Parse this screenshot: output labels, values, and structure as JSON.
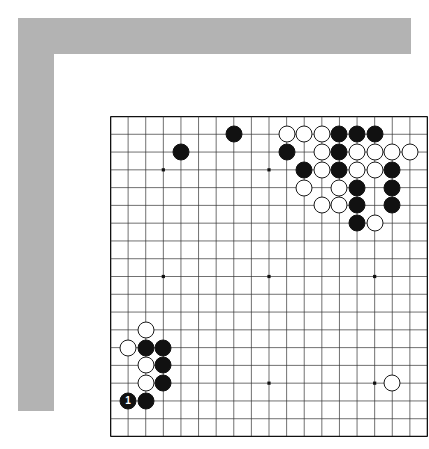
{
  "diagram": {
    "kind": "go-board-diagram",
    "board_size": 19,
    "frame_color": "#b3b3b3",
    "mat_color": "#ffffff",
    "board_color": "#ffffff",
    "line_color": "#333333",
    "border_color": "#111111",
    "black_stone_color": "#111111",
    "white_stone_color": "#ffffff",
    "star_points": [
      {
        "col": 4,
        "row": 4
      },
      {
        "col": 10,
        "row": 4
      },
      {
        "col": 16,
        "row": 4
      },
      {
        "col": 4,
        "row": 10
      },
      {
        "col": 10,
        "row": 10
      },
      {
        "col": 16,
        "row": 10
      },
      {
        "col": 4,
        "row": 16
      },
      {
        "col": 10,
        "row": 16
      },
      {
        "col": 16,
        "row": 16
      }
    ],
    "stones": [
      {
        "col": 8,
        "row": 2,
        "color": "black",
        "label": ""
      },
      {
        "col": 5,
        "row": 3,
        "color": "black",
        "label": ""
      },
      {
        "col": 11,
        "row": 2,
        "color": "white",
        "label": ""
      },
      {
        "col": 12,
        "row": 2,
        "color": "white",
        "label": ""
      },
      {
        "col": 13,
        "row": 2,
        "color": "white",
        "label": ""
      },
      {
        "col": 14,
        "row": 2,
        "color": "black",
        "label": ""
      },
      {
        "col": 15,
        "row": 2,
        "color": "black",
        "label": ""
      },
      {
        "col": 16,
        "row": 2,
        "color": "black",
        "label": ""
      },
      {
        "col": 11,
        "row": 3,
        "color": "black",
        "label": ""
      },
      {
        "col": 13,
        "row": 3,
        "color": "white",
        "label": ""
      },
      {
        "col": 14,
        "row": 3,
        "color": "black",
        "label": ""
      },
      {
        "col": 15,
        "row": 3,
        "color": "white",
        "label": ""
      },
      {
        "col": 16,
        "row": 3,
        "color": "white",
        "label": ""
      },
      {
        "col": 17,
        "row": 3,
        "color": "white",
        "label": ""
      },
      {
        "col": 18,
        "row": 3,
        "color": "white",
        "label": ""
      },
      {
        "col": 12,
        "row": 4,
        "color": "black",
        "label": ""
      },
      {
        "col": 13,
        "row": 4,
        "color": "white",
        "label": ""
      },
      {
        "col": 14,
        "row": 4,
        "color": "black",
        "label": ""
      },
      {
        "col": 15,
        "row": 4,
        "color": "white",
        "label": ""
      },
      {
        "col": 16,
        "row": 4,
        "color": "white",
        "label": ""
      },
      {
        "col": 17,
        "row": 4,
        "color": "black",
        "label": ""
      },
      {
        "col": 12,
        "row": 5,
        "color": "white",
        "label": ""
      },
      {
        "col": 14,
        "row": 5,
        "color": "white",
        "label": ""
      },
      {
        "col": 15,
        "row": 5,
        "color": "black",
        "label": ""
      },
      {
        "col": 17,
        "row": 5,
        "color": "black",
        "label": ""
      },
      {
        "col": 13,
        "row": 6,
        "color": "white",
        "label": ""
      },
      {
        "col": 14,
        "row": 6,
        "color": "white",
        "label": ""
      },
      {
        "col": 15,
        "row": 6,
        "color": "black",
        "label": ""
      },
      {
        "col": 17,
        "row": 6,
        "color": "black",
        "label": ""
      },
      {
        "col": 15,
        "row": 7,
        "color": "black",
        "label": ""
      },
      {
        "col": 16,
        "row": 7,
        "color": "white",
        "label": ""
      },
      {
        "col": 3,
        "row": 13,
        "color": "white",
        "label": ""
      },
      {
        "col": 2,
        "row": 14,
        "color": "white",
        "label": ""
      },
      {
        "col": 3,
        "row": 14,
        "color": "black",
        "label": ""
      },
      {
        "col": 4,
        "row": 14,
        "color": "black",
        "label": ""
      },
      {
        "col": 3,
        "row": 15,
        "color": "white",
        "label": ""
      },
      {
        "col": 4,
        "row": 15,
        "color": "black",
        "label": ""
      },
      {
        "col": 3,
        "row": 16,
        "color": "white",
        "label": ""
      },
      {
        "col": 4,
        "row": 16,
        "color": "black",
        "label": ""
      },
      {
        "col": 2,
        "row": 17,
        "color": "black",
        "label": "1"
      },
      {
        "col": 3,
        "row": 17,
        "color": "black",
        "label": ""
      },
      {
        "col": 17,
        "row": 16,
        "color": "white",
        "label": ""
      }
    ]
  }
}
